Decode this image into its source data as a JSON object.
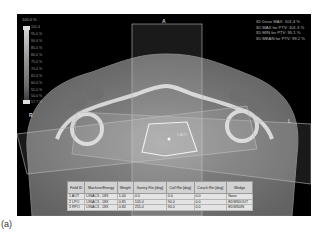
{
  "view": {
    "orientation": {
      "anterior": "A",
      "right": "R",
      "left": "L"
    },
    "scale": {
      "header": "100.0 %",
      "top_value": "101.4",
      "ticks": [
        "95.0 %",
        "90.0 %",
        "85.0 %",
        "80.0 %",
        "75.0 %",
        "70.0 %",
        "65.0 %",
        "60.0 %",
        "55.0 %",
        "50.0 %"
      ],
      "bottom_value": "17.7 %"
    },
    "stats": [
      "3D Dose MAX: 101.4 %",
      "3D MAX for PTV: 101.3 %",
      "3D MIN for PTV: 95.1 %",
      "3D MEAN for PTV: 99.2 %"
    ],
    "field_label": "1 AOT"
  },
  "table": {
    "headers": [
      "Field ID",
      "Machine/Energy",
      "Weight",
      "Gantry Rtn [deg]",
      "Coll Rtn [deg]",
      "Couch Rtn [deg]",
      "Wedge"
    ],
    "rows": [
      [
        "1 AOT",
        "LINAC3 - 18X",
        "1.00",
        "0.0",
        "0.0",
        "0.0",
        "None"
      ],
      [
        "2 LPO",
        "LINAC3 - 18X",
        "0.85",
        "105.0",
        "90.0",
        "0.0",
        "EDW30OUT"
      ],
      [
        "3 RPO",
        "LINAC3 - 18X",
        "0.84",
        "255.0",
        "90.0",
        "0.0",
        "EDW30IN"
      ]
    ]
  },
  "caption": "(a)"
}
